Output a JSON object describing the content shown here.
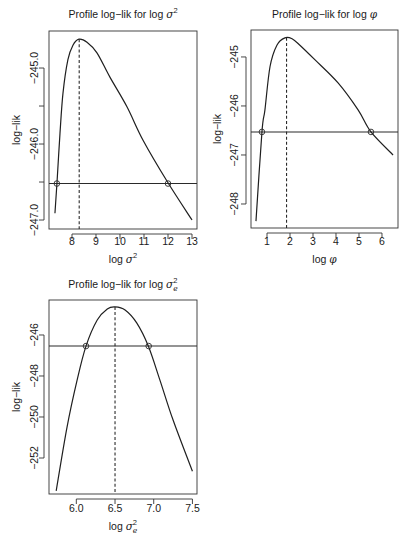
{
  "figure": {
    "background": "#ffffff",
    "line_color": "#1f1f1f"
  },
  "chart_data": [
    {
      "type": "line",
      "title": "Profile log−lik for log σ²",
      "title_parts": {
        "prefix": "Profile log−lik for log ",
        "symbol": "σ",
        "sub": "",
        "sup": "2"
      },
      "xlabel": "log σ²",
      "xlabel_parts": {
        "prefix": "log ",
        "symbol": "σ",
        "sub": "",
        "sup": "2"
      },
      "ylabel": "log−lik",
      "xlim": [
        7.042,
        13.208
      ],
      "ylim": [
        -247.118,
        -244.513
      ],
      "xticks": [
        8,
        9,
        10,
        11,
        12,
        13
      ],
      "xtick_labels": [
        "8",
        "9",
        "10",
        "11",
        "12",
        "13"
      ],
      "yticks": [
        -245.0,
        -245.5,
        -246.0,
        -246.5,
        -247.0
      ],
      "ytick_labels": [
        "-245.0",
        "",
        "-246.0",
        "",
        "-247.0"
      ],
      "grid": false,
      "x": [
        7.29,
        7.375,
        7.5,
        7.625,
        7.83,
        8.04,
        8.29,
        8.625,
        9.04,
        9.58,
        10.29,
        10.96,
        12.0,
        13.0
      ],
      "y": [
        -246.91,
        -246.51,
        -245.86,
        -245.33,
        -244.89,
        -244.7,
        -244.62,
        -244.66,
        -244.8,
        -245.12,
        -245.51,
        -245.95,
        -246.51,
        -247.0
      ],
      "mle": {
        "x": 8.3,
        "y": -244.62
      },
      "cutoff_y": -246.52,
      "ci_points": [
        {
          "x": 7.37,
          "y": -246.52
        },
        {
          "x": 12.0,
          "y": -246.52
        }
      ]
    },
    {
      "type": "line",
      "title": "Profile log−lik for log φ",
      "title_parts": {
        "prefix": "Profile log−lik for log ",
        "symbol": "φ",
        "sub": "",
        "sup": ""
      },
      "xlabel": "log φ",
      "xlabel_parts": {
        "prefix": "log ",
        "symbol": "φ",
        "sub": "",
        "sup": ""
      },
      "ylabel": "log−lik",
      "xlim": [
        0.304,
        6.696
      ],
      "ylim": [
        -248.49,
        -244.45
      ],
      "xticks": [
        1,
        2,
        3,
        4,
        5,
        6
      ],
      "xtick_labels": [
        "1",
        "2",
        "3",
        "4",
        "5",
        "6"
      ],
      "yticks": [
        -245,
        -246,
        -247,
        -248
      ],
      "ytick_labels": [
        "-245",
        "-246",
        "-247",
        "-248"
      ],
      "grid": false,
      "x": [
        0.52,
        0.78,
        0.91,
        1.13,
        1.43,
        1.78,
        2.09,
        2.43,
        3.09,
        4.09,
        4.96,
        5.52,
        6.48
      ],
      "y": [
        -248.35,
        -246.53,
        -246.08,
        -245.2,
        -244.76,
        -244.61,
        -244.63,
        -244.76,
        -245.06,
        -245.53,
        -246.08,
        -246.53,
        -247.0
      ],
      "mle": {
        "x": 1.85,
        "y": -244.61
      },
      "cutoff_y": -246.53,
      "ci_points": [
        {
          "x": 0.78,
          "y": -246.53
        },
        {
          "x": 5.52,
          "y": -246.53
        }
      ]
    },
    {
      "type": "line",
      "title": "Profile log−lik for log σₑ²",
      "title_parts": {
        "prefix": "Profile log−lik for log ",
        "symbol": "σ",
        "sub": "e",
        "sup": "2"
      },
      "xlabel": "log σₑ²",
      "xlabel_parts": {
        "prefix": "log ",
        "symbol": "σ",
        "sub": "e",
        "sup": "2"
      },
      "ylabel": "log−lik",
      "xlim": [
        5.647,
        7.559
      ],
      "ylim": [
        -253.756,
        -244.293
      ],
      "xticks": [
        6.0,
        6.5,
        7.0,
        7.5
      ],
      "xtick_labels": [
        "6.0",
        "6.5",
        "7.0",
        "7.5"
      ],
      "yticks": [
        -246,
        -248,
        -250,
        -252
      ],
      "ytick_labels": [
        "-246",
        "-248",
        "-250",
        "-252"
      ],
      "grid": false,
      "x": [
        5.74,
        5.88,
        6.01,
        6.125,
        6.27,
        6.4,
        6.5,
        6.63,
        6.78,
        6.93,
        7.08,
        7.25,
        7.5
      ],
      "y": [
        -253.6,
        -250.49,
        -248.2,
        -246.54,
        -245.27,
        -244.73,
        -244.63,
        -244.78,
        -245.41,
        -246.54,
        -248.2,
        -250.15,
        -252.65
      ],
      "mle": {
        "x": 6.5,
        "y": -244.63
      },
      "cutoff_y": -246.54,
      "ci_points": [
        {
          "x": 6.125,
          "y": -246.54
        },
        {
          "x": 6.935,
          "y": -246.54
        }
      ]
    }
  ]
}
